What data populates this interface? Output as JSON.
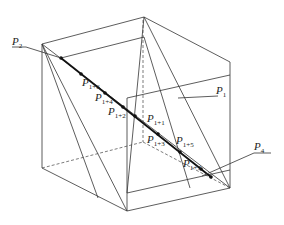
{
  "diagram": {
    "type": "cube-section-geometry",
    "labels": {
      "p2": {
        "base": "P",
        "sub": "2"
      },
      "p1": {
        "base": "P",
        "sub": "1"
      },
      "p4": {
        "base": "P",
        "sub": "4"
      },
      "p1p6": {
        "base": "P",
        "sub": "1+6"
      },
      "p1p4": {
        "base": "P",
        "sub": "1+4"
      },
      "p1p2": {
        "base": "P",
        "sub": "1+2"
      },
      "p1p1": {
        "base": "P",
        "sub": "1+1"
      },
      "p1p3": {
        "base": "P",
        "sub": "1+3"
      },
      "p1p5": {
        "base": "P",
        "sub": "1+5"
      },
      "p1p7": {
        "base": "P",
        "sub": "1+7"
      }
    },
    "colors": {
      "line": "#333333",
      "thick": "#111111",
      "background": "#ffffff"
    }
  }
}
